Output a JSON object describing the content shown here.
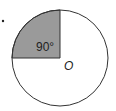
{
  "diagram": {
    "angle_label": "90°",
    "center_label": "O",
    "shaded_color": "#9a9a9a",
    "stroke_color": "#333333"
  }
}
